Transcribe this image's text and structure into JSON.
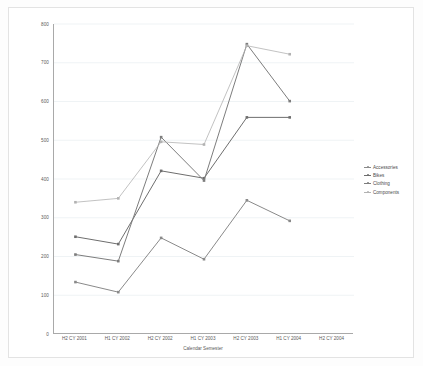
{
  "chart_data": {
    "type": "line",
    "title": "",
    "xlabel": "Calendar Semester",
    "ylabel": "",
    "grid": true,
    "legend_position": "right",
    "ylim": [
      0,
      800
    ],
    "yticks": [
      0,
      100,
      200,
      300,
      400,
      500,
      600,
      700,
      800
    ],
    "categories": [
      "H2 CY 2001",
      "H1 CY 2002",
      "H2 CY 2002",
      "H1 CY 2003",
      "H2 CY 2003",
      "H1 CY 2004",
      "H2 CY 2004"
    ],
    "series": [
      {
        "name": "Accessories",
        "color": "#8a8a8a",
        "values": [
          134,
          108,
          248,
          193,
          345,
          292,
          null
        ]
      },
      {
        "name": "Bikes",
        "color": "#6e6e6e",
        "values": [
          251,
          232,
          421,
          402,
          559,
          559,
          null
        ]
      },
      {
        "name": "Clothing",
        "color": "#7d7d7d",
        "values": [
          205,
          188,
          508,
          396,
          748,
          601,
          null
        ]
      },
      {
        "name": "Components",
        "color": "#b2b2b2",
        "values": [
          340,
          350,
          496,
          489,
          744,
          722,
          null
        ]
      }
    ]
  },
  "legend": {
    "items": [
      {
        "label": "Accessories"
      },
      {
        "label": "Bikes"
      },
      {
        "label": "Clothing"
      },
      {
        "label": "Components"
      }
    ]
  },
  "axes": {
    "y_labels": [
      "800",
      "700",
      "600",
      "500",
      "400",
      "300",
      "200",
      "100",
      "0"
    ],
    "x_labels": [
      "H2 CY 2001",
      "H1 CY 2002",
      "H2 CY 2002",
      "H1 CY 2003",
      "H2 CY 2003",
      "H1 CY 2004",
      "H2 CY 2004"
    ],
    "x_title": "Calendar Semester"
  }
}
